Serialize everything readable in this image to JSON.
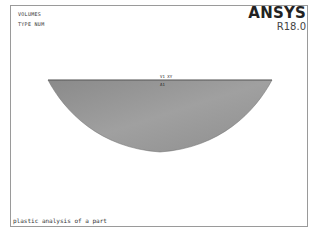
{
  "window": {
    "app": "ANSYS",
    "version": "R18.0"
  },
  "plot_info": {
    "line1": "VOLUMES",
    "line2": "TYPE NUM"
  },
  "labels": {
    "top": "V1 XY",
    "sub": "A1"
  },
  "caption": "plastic analysis of a part",
  "colors": {
    "shape_fill_light": "#9d9d9d",
    "shape_fill_dark": "#7a7a7a",
    "frame": "#9a9a9a",
    "background": "#ffffff"
  }
}
